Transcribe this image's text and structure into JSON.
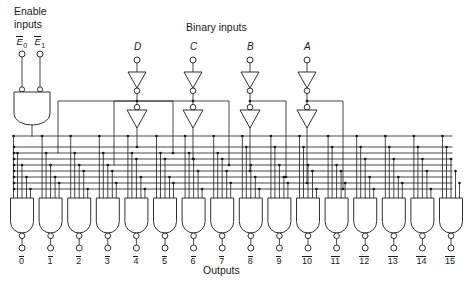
{
  "figure": {
    "kind": "logic-diagram",
    "line_color": "#1a1a1a",
    "background": "#ffffff"
  },
  "labels": {
    "enable_title_line1": "Enable",
    "enable_title_line2": "inputs",
    "binary_title": "Binary  inputs",
    "outputs_title": "Outputs"
  },
  "enable": {
    "inputs": [
      {
        "name": "E0",
        "letter": "E",
        "sub": "0",
        "overline": true,
        "x": 22
      },
      {
        "name": "E1",
        "letter": "E",
        "sub": "1",
        "overline": true,
        "x": 40
      }
    ],
    "gate": "and-gate",
    "gate_bubbled_inputs": true
  },
  "binary_inputs": [
    {
      "label": "D",
      "x": 137,
      "weight": 8
    },
    {
      "label": "C",
      "x": 193,
      "weight": 4
    },
    {
      "label": "B",
      "x": 250,
      "weight": 2
    },
    {
      "label": "A",
      "x": 307,
      "weight": 1
    }
  ],
  "outputs": [
    {
      "label": "0",
      "overline": true
    },
    {
      "label": "1",
      "overline": true
    },
    {
      "label": "2",
      "overline": true
    },
    {
      "label": "3",
      "overline": true
    },
    {
      "label": "4",
      "overline": true
    },
    {
      "label": "5",
      "overline": true
    },
    {
      "label": "6",
      "overline": true
    },
    {
      "label": "7",
      "overline": true
    },
    {
      "label": "8",
      "overline": true
    },
    {
      "label": "9",
      "overline": true
    },
    {
      "label": "10",
      "overline": true
    },
    {
      "label": "11",
      "overline": true
    },
    {
      "label": "12",
      "overline": true
    },
    {
      "label": "13",
      "overline": true
    },
    {
      "label": "14",
      "overline": true
    },
    {
      "label": "15",
      "overline": true
    }
  ],
  "gates": {
    "count": 16,
    "type": "nand-gate",
    "inputs_per_gate": 5,
    "first_x": 22,
    "pitch": 28.6,
    "width": 23,
    "top_y": 198,
    "bottom_y": 233
  },
  "bus": {
    "note": "Enable line plus true/complement lines for A,B,C,D",
    "rows": [
      {
        "name": "enable",
        "y": 136
      },
      {
        "name": "D-true",
        "y": 147
      },
      {
        "name": "D-comp",
        "y": 153
      },
      {
        "name": "C-true",
        "y": 159
      },
      {
        "name": "C-comp",
        "y": 165
      },
      {
        "name": "B-true",
        "y": 171
      },
      {
        "name": "B-comp",
        "y": 177
      },
      {
        "name": "A-true",
        "y": 183
      },
      {
        "name": "A-comp",
        "y": 189
      }
    ]
  }
}
